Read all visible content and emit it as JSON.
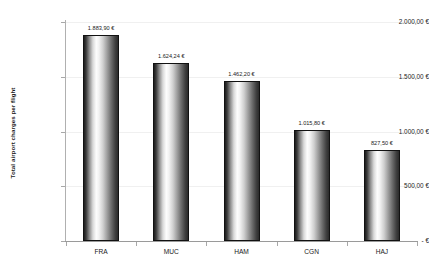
{
  "chart_data": {
    "type": "bar",
    "title": "",
    "xlabel": "",
    "ylabel": "Total airport charges per flight",
    "categories": [
      "FRA",
      "MUC",
      "HAM",
      "CGN",
      "HAJ"
    ],
    "values": [
      1883.9,
      1624.24,
      1462.2,
      1015.8,
      827.5
    ],
    "value_labels": [
      "1.883,90 €",
      "1.624,24 €",
      "1.462,20 €",
      "1.015,80 €",
      "827,50 €"
    ],
    "ylim": [
      0,
      2000
    ],
    "y_ticks": [
      0,
      500,
      1000,
      1500,
      2000
    ],
    "y_tick_labels": [
      "- €",
      "500,00 €",
      "1.000,00 €",
      "1.500,00 €",
      "2.000,00 €"
    ],
    "grid": true,
    "legend": "none",
    "currency": "EUR",
    "bar_fill": "gradient-cylinder-grayscale",
    "bar_border_color": "#111111",
    "gridline_color": "#f0f0f0",
    "axis_color": "#9a9a9a",
    "background": "#ffffff"
  }
}
